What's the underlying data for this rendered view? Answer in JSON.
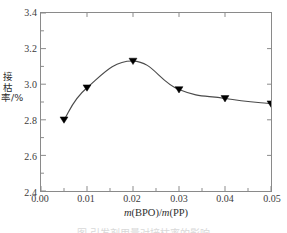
{
  "chart_data": {
    "type": "line",
    "title": "",
    "xlabel": "m(BPO)/m(PP)",
    "ylabel": "接枯率/%",
    "xlim": [
      0.0,
      0.05
    ],
    "ylim": [
      2.4,
      3.4
    ],
    "grid": false,
    "legend": null,
    "marker": "triangle-down",
    "marker_color": "#000000",
    "line_color": "#4a4a4a",
    "x": [
      0.005,
      0.01,
      0.02,
      0.03,
      0.04,
      0.05
    ],
    "values": [
      2.8,
      2.98,
      3.13,
      2.97,
      2.92,
      2.89
    ],
    "series": [
      {
        "name": "接枯率",
        "x": [
          0.005,
          0.01,
          0.02,
          0.03,
          0.04,
          0.05
        ],
        "values": [
          2.8,
          2.98,
          3.13,
          2.97,
          2.92,
          2.89
        ]
      }
    ],
    "xticks": [
      "0.00",
      "0.01",
      "0.02",
      "0.03",
      "0.04",
      "0.05"
    ],
    "xtick_values": [
      0.0,
      0.01,
      0.02,
      0.03,
      0.04,
      0.05
    ],
    "yticks": [
      "2.4",
      "2.6",
      "2.8",
      "3.0",
      "3.2",
      "3.4"
    ],
    "ytick_values": [
      2.4,
      2.6,
      2.8,
      3.0,
      3.2,
      3.4
    ],
    "x_minor_interval": 0.005,
    "y_minor_interval": 0.1
  },
  "axis": {
    "x_title_prefix_italic": "m",
    "x_title_mid": "(BPO)/",
    "x_title_italic2": "m",
    "x_title_suffix": "(PP)",
    "y_title": "接枯率/%"
  },
  "caption": {
    "text": "图 引发剂用量对接枯率的影响"
  },
  "ticks": {
    "y": [
      "3.4",
      "3.2",
      "3.0",
      "2.8",
      "2.6",
      "2.4"
    ],
    "x": [
      "0.00",
      "0.01",
      "0.02",
      "0.03",
      "0.04",
      "0.05"
    ]
  }
}
